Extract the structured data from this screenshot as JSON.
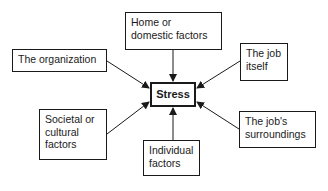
{
  "diagram": {
    "center": {
      "label": "Stress"
    },
    "factors": [
      {
        "id": "home",
        "lines": [
          "Home or",
          "domestic factors"
        ]
      },
      {
        "id": "organization",
        "lines": [
          "The organization"
        ]
      },
      {
        "id": "job-itself",
        "lines": [
          "The job",
          "itself"
        ]
      },
      {
        "id": "societal",
        "lines": [
          "Societal or",
          "cultural",
          "factors"
        ]
      },
      {
        "id": "individual",
        "lines": [
          "Individual",
          "factors"
        ]
      },
      {
        "id": "surroundings",
        "lines": [
          "The job's",
          "surroundings"
        ]
      }
    ],
    "edges": [
      {
        "from": "home",
        "to": "stress"
      },
      {
        "from": "organization",
        "to": "stress"
      },
      {
        "from": "job-itself",
        "to": "stress"
      },
      {
        "from": "societal",
        "to": "stress"
      },
      {
        "from": "individual",
        "to": "stress"
      },
      {
        "from": "surroundings",
        "to": "stress"
      }
    ],
    "colors": {
      "stroke": "#1a1a1a",
      "background": "#ffffff"
    }
  }
}
